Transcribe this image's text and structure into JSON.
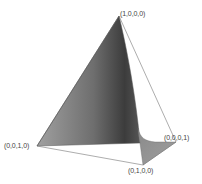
{
  "diagram": {
    "type": "3d-simplex-surface",
    "vertices": [
      {
        "id": "v1",
        "label": "(1,0,0,0)",
        "x": 119,
        "y": 16
      },
      {
        "id": "v2",
        "label": "(0,0,1,0)",
        "x": 37,
        "y": 146
      },
      {
        "id": "v3",
        "label": "(0,0,0,1)",
        "x": 176,
        "y": 142
      },
      {
        "id": "v4",
        "label": "(0,1,0,0)",
        "x": 143,
        "y": 165
      }
    ],
    "colors": {
      "background": "#ffffff",
      "edge": "#777777",
      "surface_light": "#9a9a9a",
      "surface_dark": "#3a3a3a",
      "label": "#444444"
    }
  }
}
